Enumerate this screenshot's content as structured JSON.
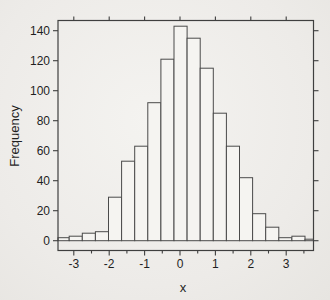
{
  "figure": {
    "background": "#edebe8",
    "frame_color": "#3f3f3f",
    "text_color": "#1f1f1f"
  },
  "chart_data": {
    "type": "bar",
    "subtype": "histogram",
    "title": "",
    "xlabel": "x",
    "ylabel": "Frequency",
    "bin_edges": [
      -3.5,
      -3.13,
      -2.76,
      -2.39,
      -2.02,
      -1.65,
      -1.28,
      -0.91,
      -0.54,
      -0.17,
      0.2,
      0.57,
      0.94,
      1.31,
      1.68,
      2.05,
      2.42,
      2.79,
      3.16,
      3.53,
      3.9
    ],
    "values": [
      2,
      3,
      5,
      6,
      29,
      53,
      63,
      92,
      121,
      143,
      135,
      115,
      85,
      63,
      42,
      18,
      9,
      2,
      3,
      1
    ],
    "total_count": 1000,
    "x_ticks": [
      -3,
      -2,
      -1,
      0,
      1,
      2,
      3
    ],
    "x_tick_labels": [
      "-3",
      "-2",
      "-1",
      "0",
      "1",
      "2",
      "3"
    ],
    "x_minor_ticks": [
      -2.5,
      -1.5,
      -0.5,
      0.5,
      1.5,
      2.5,
      3.5
    ],
    "y_ticks": [
      0,
      20,
      40,
      60,
      80,
      100,
      120,
      140
    ],
    "y_tick_labels": [
      "0",
      "20",
      "40",
      "60",
      "80",
      "100",
      "120",
      "140"
    ],
    "xlim": [
      -3.45,
      3.78
    ],
    "ylim": [
      -6,
      147
    ],
    "grid": false,
    "legend": null,
    "bar_fill": "#f5f4f1",
    "bar_stroke": "#4a4a4a"
  }
}
